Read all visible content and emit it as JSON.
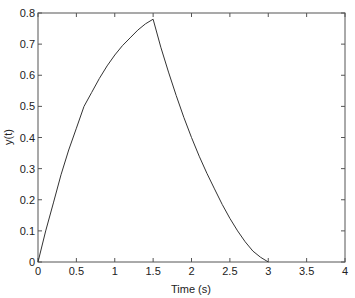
{
  "chart_data": {
    "type": "line",
    "title": "",
    "xlabel": "Time (s)",
    "ylabel": "y(t)",
    "xlim": [
      0,
      4
    ],
    "ylim": [
      0,
      0.8
    ],
    "grid": false,
    "legend": null,
    "xticks": [
      0,
      0.5,
      1,
      1.5,
      2,
      2.5,
      3,
      3.5,
      4
    ],
    "xtick_labels": [
      "0",
      "0.5",
      "1",
      "1.5",
      "2",
      "2.5",
      "3",
      "3.5",
      "4"
    ],
    "yticks": [
      0,
      0.1,
      0.2,
      0.3,
      0.4,
      0.5,
      0.6,
      0.7,
      0.8
    ],
    "ytick_labels": [
      "0",
      "0.1",
      "0.2",
      "0.3",
      "0.4",
      "0.5",
      "0.6",
      "0.7",
      "0.8"
    ],
    "series": [
      {
        "name": "y(t)",
        "color": "#333333",
        "x": [
          0,
          0.1,
          0.2,
          0.3,
          0.4,
          0.5,
          0.6,
          0.7,
          0.8,
          0.9,
          1.0,
          1.1,
          1.2,
          1.3,
          1.4,
          1.5,
          1.6,
          1.7,
          1.8,
          1.9,
          2.0,
          2.1,
          2.2,
          2.3,
          2.4,
          2.5,
          2.6,
          2.7,
          2.8,
          2.9,
          3.0
        ],
        "y": [
          0,
          0.1,
          0.19,
          0.28,
          0.36,
          0.43,
          0.5,
          0.545,
          0.59,
          0.63,
          0.665,
          0.695,
          0.72,
          0.745,
          0.765,
          0.78,
          0.69,
          0.61,
          0.535,
          0.465,
          0.4,
          0.34,
          0.285,
          0.235,
          0.185,
          0.14,
          0.1,
          0.065,
          0.035,
          0.015,
          0
        ]
      }
    ]
  },
  "axes": {
    "xlabel": "Time (s)",
    "ylabel": "y(t)"
  }
}
